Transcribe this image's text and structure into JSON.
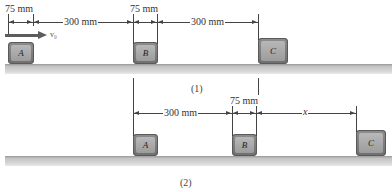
{
  "figure1": {
    "caption": "(1)",
    "dim_A_B_width": "75 mm",
    "dim_A_to_B": "300 mm",
    "dim_B_width": "75 mm",
    "dim_B_to_C": "300 mm",
    "velocity_label": "v₀",
    "blocks": [
      {
        "label": "A"
      },
      {
        "label": "B"
      },
      {
        "label": "C"
      }
    ]
  },
  "figure2": {
    "caption": "(2)",
    "dim_A_to_B": "300 mm",
    "dim_B_width": "75 mm",
    "dim_B_to_C": "x",
    "blocks": [
      {
        "label": "A"
      },
      {
        "label": "B"
      },
      {
        "label": "C"
      }
    ]
  },
  "colors": {
    "block_outer": "#7a7a7a",
    "block_face": "#aaaaaa",
    "ground": "#c8c8c8",
    "line": "#444444"
  }
}
